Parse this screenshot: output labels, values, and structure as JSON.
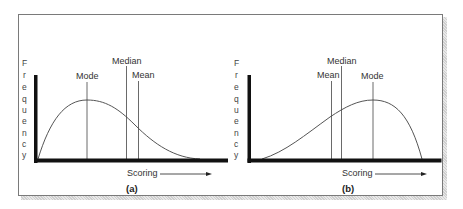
{
  "panels": [
    {
      "id": "a",
      "caption": "(a)",
      "y_axis_label": [
        "F",
        "r",
        "e",
        "q",
        "u",
        "e",
        "n",
        "c",
        "y"
      ],
      "x_axis_label": "Scoring",
      "skew": "positive",
      "markers": [
        {
          "name": "Mode",
          "label": "Mode"
        },
        {
          "name": "Median",
          "label": "Median"
        },
        {
          "name": "Mean",
          "label": "Mean"
        }
      ]
    },
    {
      "id": "b",
      "caption": "(b)",
      "y_axis_label": [
        "F",
        "r",
        "e",
        "q",
        "u",
        "e",
        "n",
        "c",
        "y"
      ],
      "x_axis_label": "Scoring",
      "skew": "negative",
      "markers": [
        {
          "name": "Mean",
          "label": "Mean"
        },
        {
          "name": "Median",
          "label": "Median"
        },
        {
          "name": "Mode",
          "label": "Mode"
        }
      ]
    }
  ],
  "colors": {
    "axis": "#111111",
    "curve": "#555555",
    "text": "#333333",
    "border": "#7a7a7a"
  }
}
